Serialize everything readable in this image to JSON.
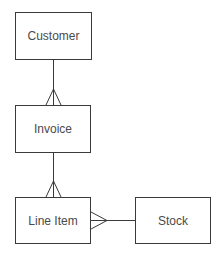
{
  "diagram": {
    "type": "entity-relationship",
    "notation": "crow's foot",
    "entities": [
      {
        "id": "customer",
        "label": "Customer"
      },
      {
        "id": "invoice",
        "label": "Invoice"
      },
      {
        "id": "line_item",
        "label": "Line Item"
      },
      {
        "id": "stock",
        "label": "Stock"
      }
    ],
    "relationships": [
      {
        "from": "Customer",
        "to": "Invoice",
        "cardinality": "one-to-many"
      },
      {
        "from": "Invoice",
        "to": "Line Item",
        "cardinality": "one-to-many"
      },
      {
        "from": "Stock",
        "to": "Line Item",
        "cardinality": "one-to-many"
      }
    ],
    "colors": {
      "line": "#3a3a3a",
      "text": "#4a4a4a",
      "background": "#ffffff"
    }
  }
}
